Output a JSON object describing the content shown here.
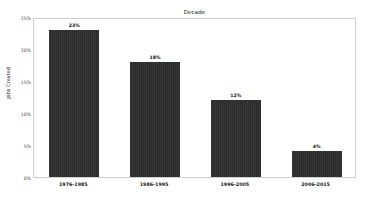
{
  "chart_data": {
    "type": "bar",
    "title": "Decade",
    "xlabel": "",
    "ylabel": "Jobs Created",
    "categories": [
      "1976-1985",
      "1986-1995",
      "1996-2005",
      "2006-2015"
    ],
    "values": [
      23,
      18,
      12,
      4
    ],
    "value_labels": [
      "23%",
      "18%",
      "12%",
      "4%"
    ],
    "ylim": [
      0,
      25
    ],
    "yticks": [
      0,
      5,
      10,
      15,
      20,
      25
    ],
    "ytick_labels": [
      "0%",
      "5%",
      "10%",
      "15%",
      "20%",
      "25%"
    ],
    "grid": false,
    "legend": "none",
    "bar_color": "#2b2b2b",
    "background_color": "#ffffff",
    "frame_color": "#cfcfcf"
  }
}
